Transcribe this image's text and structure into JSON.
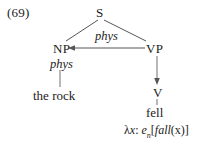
{
  "example": {
    "number": "(69)"
  },
  "tree": {
    "nodes": {
      "s": "S",
      "np": "NP",
      "vp": "VP",
      "v": "V"
    },
    "features": {
      "arrow_label": "phys",
      "np_label": "phys"
    },
    "terminals": {
      "np_word": "the rock",
      "v_word": "fell"
    },
    "semantics": {
      "lambda": "λ",
      "variable": "x",
      "colon": ": ",
      "type_base": "e",
      "type_subscript": "n",
      "open_bracket": "[",
      "predicate": "fall",
      "arg_open": "(",
      "argument": "x",
      "arg_close": ")",
      "close_bracket": "]",
      "full": "λx: eₙ[fall(x)]"
    }
  },
  "style": {
    "line_color": "#555555",
    "text_color": "#1b1b1b",
    "background": "#ffffff"
  }
}
